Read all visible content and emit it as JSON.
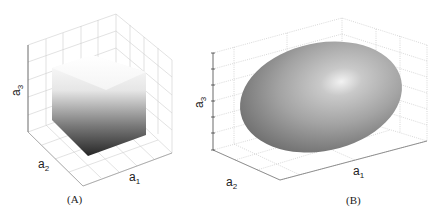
{
  "figure": {
    "panels": [
      {
        "id": "A",
        "caption": "(A)",
        "shape": "cube",
        "axes": {
          "x": {
            "base": "a",
            "sub": "1"
          },
          "y": {
            "base": "a",
            "sub": "2"
          },
          "z": {
            "base": "a",
            "sub": "3"
          }
        },
        "shading": {
          "top": "#ffffff",
          "bottom": "#2a2a2a"
        }
      },
      {
        "id": "B",
        "caption": "(B)",
        "shape": "ellipsoid",
        "axes": {
          "x": {
            "base": "a",
            "sub": "1"
          },
          "y": {
            "base": "a",
            "sub": "2"
          },
          "z": {
            "base": "a",
            "sub": "3"
          }
        },
        "shading": {
          "highlight": "#f4f4f4",
          "mid": "#a9a9a9",
          "edge": "#6e6e6e"
        }
      }
    ]
  }
}
